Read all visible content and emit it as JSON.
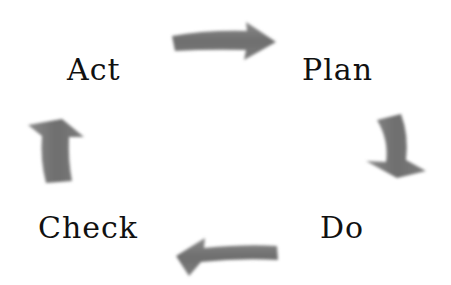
{
  "diagram": {
    "type": "cycle",
    "steps": [
      {
        "label": "Plan"
      },
      {
        "label": "Do"
      },
      {
        "label": "Check"
      },
      {
        "label": "Act"
      }
    ],
    "arrow_color": "#7a7a7a",
    "text_color": "#111111",
    "background": "#ffffff",
    "arrows": [
      {
        "from": "Act",
        "to": "Plan",
        "direction": "right"
      },
      {
        "from": "Plan",
        "to": "Do",
        "direction": "down"
      },
      {
        "from": "Do",
        "to": "Check",
        "direction": "left"
      },
      {
        "from": "Check",
        "to": "Act",
        "direction": "up"
      }
    ]
  }
}
